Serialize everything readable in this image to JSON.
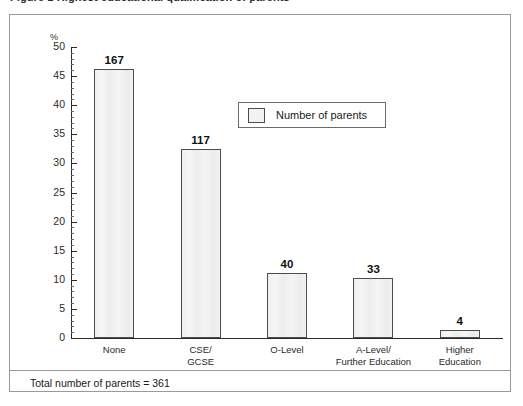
{
  "figure": {
    "caption": "Figure 1  Highest educational qualification of parents"
  },
  "chart_data": {
    "type": "bar",
    "title": "",
    "subtitle": "",
    "xlabel": "",
    "ylabel": "%",
    "ylim": [
      0,
      50
    ],
    "ytick_step": 5,
    "yminor_step": 1,
    "grid": false,
    "legend_position": "inside-top-center",
    "categories": [
      "None",
      "CSE/\nGCSE",
      "O-Level",
      "A-Level/\nFurther Education",
      "Higher\nEducation"
    ],
    "series": [
      {
        "name": "Number of parents",
        "counts": [
          167,
          117,
          40,
          33,
          4
        ],
        "values": [
          46.3,
          32.4,
          11.1,
          10.3,
          1.4
        ]
      }
    ],
    "point_labels": [
      "167",
      "117",
      "40",
      "33",
      "4"
    ],
    "ytick_labels": [
      "0",
      "5",
      "10",
      "15",
      "20",
      "25",
      "30",
      "35",
      "40",
      "45",
      "50"
    ],
    "annotations": [
      "Total number of parents = 361"
    ],
    "colors": {
      "bar_fill": "#f2f2f2",
      "bar_stroke": "#4d4d4d",
      "axis": "#2a2a2a",
      "frame": "#9a9a9a",
      "text": "#1a1a1a"
    }
  },
  "legend": {
    "label": "Number of parents"
  },
  "footer": {
    "note": "Total number of parents = 361"
  }
}
